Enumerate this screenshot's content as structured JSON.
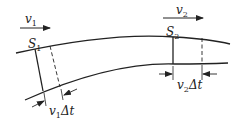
{
  "diagram": {
    "labels": {
      "v1": "v",
      "v1_sub": "1",
      "v2": "v",
      "v2_sub": "2",
      "s1": "S",
      "s1_sub": "1",
      "s2": "S",
      "s2_sub": "2",
      "v1dt_v": "v",
      "v1dt_sub": "1",
      "v1dt_rest": "Δt",
      "v2dt_v": "v",
      "v2dt_sub": "2",
      "v2dt_rest": "Δt"
    },
    "colors": {
      "stroke": "#222222",
      "background": "#ffffff"
    }
  }
}
